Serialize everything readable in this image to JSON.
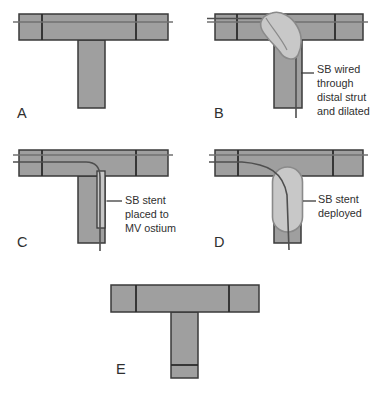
{
  "colors": {
    "background": "#ffffff",
    "vessel_fill": "#9f9f9f",
    "vessel_outline": "#3a3a3a",
    "strut_line": "#2b2b2b",
    "wire_mv": "#707070",
    "wire_sb": "#4f4f4f",
    "balloon_fill": "#c8c8c8",
    "balloon_outline": "#8a8a8a",
    "stent_fill": "#c6c6c6",
    "leader": "#3b3b3b",
    "text": "#2f2f2f"
  },
  "panels": [
    {
      "id": "A",
      "label": "A"
    },
    {
      "id": "B",
      "label": "B",
      "annotation": {
        "lines": [
          "SB wired",
          "through",
          "distal strut",
          "and dilated"
        ]
      }
    },
    {
      "id": "C",
      "label": "C",
      "annotation": {
        "lines": [
          "SB stent",
          "placed to",
          "MV ostium"
        ]
      }
    },
    {
      "id": "D",
      "label": "D",
      "annotation": {
        "lines": [
          "SB stent",
          "deployed"
        ]
      }
    },
    {
      "id": "E",
      "label": "E"
    }
  ]
}
